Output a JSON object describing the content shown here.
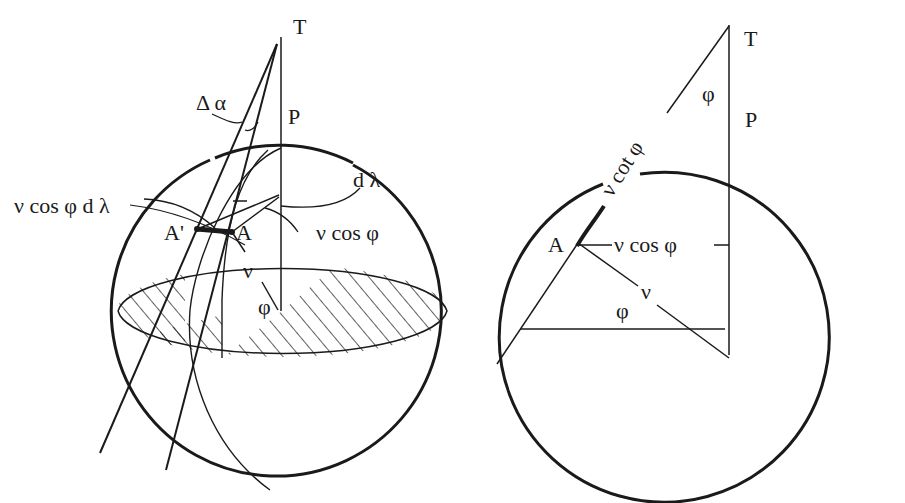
{
  "figure": {
    "left_panel": {
      "labels": {
        "T": "T",
        "P": "P",
        "delta_alpha": "Δ α",
        "d_lambda": "d λ",
        "nu_cos_phi_d_lambda": "ν cos  φ d  λ",
        "nu_cos_phi": "ν cos  φ",
        "A_prime": "A'",
        "A": "A",
        "nu": "ν",
        "phi": "φ"
      }
    },
    "right_panel": {
      "labels": {
        "T": "T",
        "P": "P",
        "phi_top": "φ",
        "nu_cot_phi": "ν cot φ",
        "A": "A",
        "nu_cos_phi": "ν cos  φ",
        "nu": "ν",
        "phi_bottom": "φ"
      }
    },
    "colors": {
      "ink": "#1a1a1a",
      "background": "#ffffff"
    }
  }
}
